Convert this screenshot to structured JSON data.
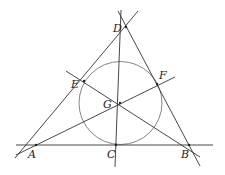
{
  "diagram": {
    "type": "geometry",
    "points": {
      "A": {
        "label": "A",
        "x": 36,
        "y": 145,
        "lx": 28,
        "ly": 158
      },
      "B": {
        "label": "B",
        "x": 189,
        "y": 145,
        "lx": 181,
        "ly": 158
      },
      "C": {
        "label": "C",
        "x": 116,
        "y": 145,
        "lx": 107,
        "ly": 158
      },
      "D": {
        "label": "D",
        "x": 126,
        "y": 27,
        "lx": 113,
        "ly": 32
      },
      "E": {
        "label": "E",
        "x": 84,
        "y": 81,
        "lx": 71,
        "ly": 88
      },
      "F": {
        "label": "F",
        "x": 157,
        "y": 84,
        "lx": 159,
        "ly": 79
      },
      "G": {
        "label": "G",
        "x": 120,
        "y": 103,
        "lx": 103,
        "ly": 108
      }
    },
    "circle": {
      "cx": 120.5,
      "cy": 103,
      "r": 41.5
    }
  }
}
